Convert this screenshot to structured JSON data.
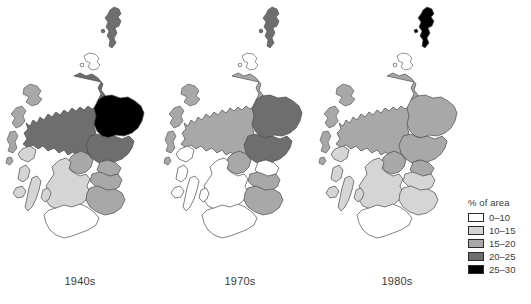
{
  "figure": {
    "legend": {
      "title": "% of area",
      "entries": [
        {
          "label": "0–10",
          "color": "#ffffff"
        },
        {
          "label": "10–15",
          "color": "#d5d5d5"
        },
        {
          "label": "15–20",
          "color": "#a8a8a8"
        },
        {
          "label": "20–25",
          "color": "#6e6e6e"
        },
        {
          "label": "25–30",
          "color": "#000000"
        }
      ]
    },
    "panels": [
      {
        "caption": "1940s"
      },
      {
        "caption": "1970s"
      },
      {
        "caption": "1980s"
      }
    ]
  },
  "chart_data": {
    "type": "map",
    "title": "",
    "subtitle": "",
    "xlabel": "",
    "ylabel": "",
    "map_region": "Scotland",
    "variable": "% of area",
    "units": "percent",
    "class_breaks": [
      0,
      10,
      15,
      20,
      25,
      30
    ],
    "class_labels": [
      "0–10",
      "10–15",
      "15–20",
      "20–25",
      "25–30"
    ],
    "class_colors": [
      "#ffffff",
      "#d5d5d5",
      "#a8a8a8",
      "#6e6e6e",
      "#000000"
    ],
    "legend_position": "right",
    "grid": false,
    "panels": [
      {
        "caption": "1940s",
        "regions": [
          {
            "name": "Shetland",
            "class": "20–25",
            "color": "#6e6e6e"
          },
          {
            "name": "Orkney",
            "class": "0–10",
            "color": "#ffffff"
          },
          {
            "name": "Western Isles",
            "class": "15–20",
            "color": "#a8a8a8"
          },
          {
            "name": "Highland",
            "class": "20–25",
            "color": "#6e6e6e"
          },
          {
            "name": "Grampian",
            "class": "25–30",
            "color": "#000000"
          },
          {
            "name": "Tayside",
            "class": "20–25",
            "color": "#6e6e6e"
          },
          {
            "name": "Central",
            "class": "15–20",
            "color": "#a8a8a8"
          },
          {
            "name": "Fife",
            "class": "15–20",
            "color": "#a8a8a8"
          },
          {
            "name": "Strathclyde",
            "class": "10–15",
            "color": "#d5d5d5"
          },
          {
            "name": "Lothian",
            "class": "15–20",
            "color": "#a8a8a8"
          },
          {
            "name": "Borders",
            "class": "15–20",
            "color": "#a8a8a8"
          },
          {
            "name": "Dumfries & Galloway",
            "class": "0–10",
            "color": "#ffffff"
          }
        ]
      },
      {
        "caption": "1970s",
        "regions": [
          {
            "name": "Shetland",
            "class": "20–25",
            "color": "#6e6e6e"
          },
          {
            "name": "Orkney",
            "class": "0–10",
            "color": "#ffffff"
          },
          {
            "name": "Western Isles",
            "class": "15–20",
            "color": "#a8a8a8"
          },
          {
            "name": "Highland",
            "class": "15–20",
            "color": "#a8a8a8"
          },
          {
            "name": "Grampian",
            "class": "20–25",
            "color": "#6e6e6e"
          },
          {
            "name": "Tayside",
            "class": "20–25",
            "color": "#6e6e6e"
          },
          {
            "name": "Central",
            "class": "15–20",
            "color": "#a8a8a8"
          },
          {
            "name": "Fife",
            "class": "0–10",
            "color": "#ffffff"
          },
          {
            "name": "Strathclyde",
            "class": "0–10",
            "color": "#ffffff"
          },
          {
            "name": "Lothian",
            "class": "15–20",
            "color": "#a8a8a8"
          },
          {
            "name": "Borders",
            "class": "15–20",
            "color": "#a8a8a8"
          },
          {
            "name": "Dumfries & Galloway",
            "class": "0–10",
            "color": "#ffffff"
          }
        ]
      },
      {
        "caption": "1980s",
        "regions": [
          {
            "name": "Shetland",
            "class": "25–30",
            "color": "#000000"
          },
          {
            "name": "Orkney",
            "class": "0–10",
            "color": "#ffffff"
          },
          {
            "name": "Western Isles",
            "class": "15–20",
            "color": "#a8a8a8"
          },
          {
            "name": "Highland",
            "class": "15–20",
            "color": "#a8a8a8"
          },
          {
            "name": "Grampian",
            "class": "15–20",
            "color": "#a8a8a8"
          },
          {
            "name": "Tayside",
            "class": "15–20",
            "color": "#a8a8a8"
          },
          {
            "name": "Central",
            "class": "15–20",
            "color": "#a8a8a8"
          },
          {
            "name": "Fife",
            "class": "15–20",
            "color": "#a8a8a8"
          },
          {
            "name": "Strathclyde",
            "class": "10–15",
            "color": "#d5d5d5"
          },
          {
            "name": "Lothian",
            "class": "10–15",
            "color": "#d5d5d5"
          },
          {
            "name": "Borders",
            "class": "10–15",
            "color": "#d5d5d5"
          },
          {
            "name": "Dumfries & Galloway",
            "class": "0–10",
            "color": "#ffffff"
          }
        ]
      }
    ]
  }
}
